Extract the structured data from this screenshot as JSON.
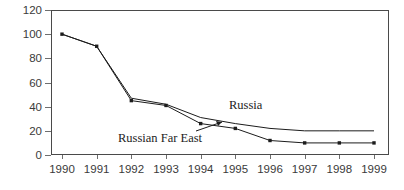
{
  "chart_data": {
    "type": "line",
    "title": "",
    "subtitle": "",
    "xlabel": "",
    "ylabel": "",
    "categories": [
      "1990",
      "1991",
      "1992",
      "1993",
      "1994",
      "1995",
      "1996",
      "1997",
      "1998",
      "1999"
    ],
    "x": [
      1990,
      1991,
      1992,
      1993,
      1994,
      1995,
      1996,
      1997,
      1998,
      1999
    ],
    "ylim": [
      0,
      120
    ],
    "xlim": [
      1990,
      1999
    ],
    "y_ticks": [
      0,
      20,
      40,
      60,
      80,
      100,
      120
    ],
    "y_tick_labels": [
      "0",
      "20",
      "40",
      "60",
      "80",
      "100",
      "120"
    ],
    "grid": false,
    "legend": "inline-labels",
    "series": [
      {
        "name": "Russia",
        "values": [
          100,
          90,
          47,
          42,
          31,
          26,
          22,
          20,
          20,
          20
        ],
        "markers": false,
        "color": "#1c1c1c"
      },
      {
        "name": "Russian Far East",
        "values": [
          100,
          90,
          45,
          41,
          26,
          22,
          12,
          10,
          10,
          10
        ],
        "markers": true,
        "color": "#1c1c1c"
      }
    ],
    "annotations": [
      {
        "text": "Russia",
        "series": "Russia"
      },
      {
        "text": "Russian Far East",
        "series": "Russian Far East"
      }
    ]
  },
  "axes": {
    "y_labels": [
      "120",
      "100",
      "80",
      "60",
      "40",
      "20",
      "0"
    ],
    "x_labels": [
      "1990",
      "1991",
      "1992",
      "1993",
      "1994",
      "1995",
      "1996",
      "1997",
      "1998",
      "1999"
    ]
  },
  "labels": {
    "russia": "Russia",
    "russian_far_east": "Russian Far East"
  },
  "colors": {
    "line": "#1c1c1c",
    "axis": "#4a4a4a",
    "tick": "#6e6e6e",
    "text": "#3a3a3a",
    "background": "#ffffff"
  }
}
